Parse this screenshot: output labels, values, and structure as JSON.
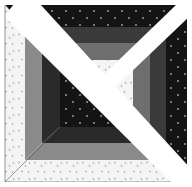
{
  "image": {
    "description": "Quilt block with concentric mitered bands and white diagonal sashing strips",
    "width": 192,
    "height": 187
  },
  "colors": {
    "background": "#ffffff",
    "black_dotted": "#141414",
    "dots": "#9a9a9a",
    "dark_gray": "#3a3a3a",
    "mid_gray": "#6e6e6e",
    "light_gray": "#8a8a8a",
    "white_speckled": "#f4f4f4",
    "speckle": "#8c8c8c",
    "sash": "#ffffff",
    "seam": "#555555"
  },
  "bands": [
    {
      "name": "outer",
      "top": "black_dotted",
      "right": "black_dotted",
      "bottom": "white_speckled",
      "left": "white_speckled"
    },
    {
      "name": "second",
      "top": "dark_gray",
      "right": "dark_gray",
      "bottom": "light_gray",
      "left": "light_gray"
    },
    {
      "name": "third",
      "top": "mid_gray",
      "right": "mid_gray",
      "bottom": "dark_gray",
      "left": "dark_gray"
    },
    {
      "name": "center",
      "fill": "black_dotted"
    }
  ],
  "sashing": [
    {
      "name": "diagonal-main",
      "from": "top-left",
      "to": "bottom-right"
    },
    {
      "name": "diagonal-half",
      "from": "top-right",
      "to": "center"
    }
  ]
}
